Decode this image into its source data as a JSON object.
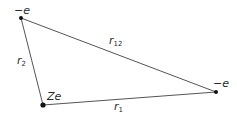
{
  "diagram": {
    "colors": {
      "line": "#555555",
      "point": "#111111",
      "text": "#2a2a2a"
    },
    "nodes": [
      {
        "id": "electron1",
        "label": "−e",
        "x": 21,
        "y": 18
      },
      {
        "id": "nucleus",
        "label": "Ze",
        "x": 43,
        "y": 105
      },
      {
        "id": "electron2",
        "label": "−e",
        "x": 216,
        "y": 92
      }
    ],
    "edges": [
      {
        "from": "nucleus",
        "to": "electron1",
        "label_main": "r",
        "label_sub": "2"
      },
      {
        "from": "electron1",
        "to": "electron2",
        "label_main": "r",
        "label_sub": "12"
      },
      {
        "from": "nucleus",
        "to": "electron2",
        "label_main": "r",
        "label_sub": "1"
      }
    ]
  }
}
